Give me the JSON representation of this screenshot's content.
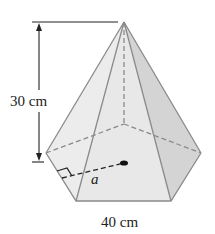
{
  "diagram": {
    "type": "hexagonal pyramid",
    "height_label": "30 cm",
    "base_side_label": "40 cm",
    "apothem_label": "a",
    "colors": {
      "stroke": "#8a8a8a",
      "face_front": "#e9e9e9",
      "face_left": "#eeeeee",
      "face_right": "#d6d6d6",
      "face_base": "#e4e4e4",
      "dim_line": "#222222"
    }
  }
}
